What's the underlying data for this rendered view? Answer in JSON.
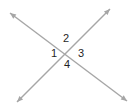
{
  "diagram": {
    "type": "geometry-intersecting-lines",
    "background": "#ffffff",
    "line_color": "#a6a6a6",
    "label_color": "#1f1f1f",
    "lines": [
      {
        "name": "line-descending",
        "x1": 10,
        "y1": 13,
        "x2": 127,
        "y2": 101,
        "arrow_start": true,
        "arrow_end": true
      },
      {
        "name": "line-ascending",
        "x1": 17,
        "y1": 102,
        "x2": 110,
        "y2": 9,
        "arrow_start": true,
        "arrow_end": true
      }
    ],
    "angle_labels": [
      {
        "label": "1",
        "x": 54,
        "y": 53
      },
      {
        "label": "2",
        "x": 66,
        "y": 38
      },
      {
        "label": "3",
        "x": 81,
        "y": 53
      },
      {
        "label": "4",
        "x": 67,
        "y": 64
      }
    ]
  }
}
